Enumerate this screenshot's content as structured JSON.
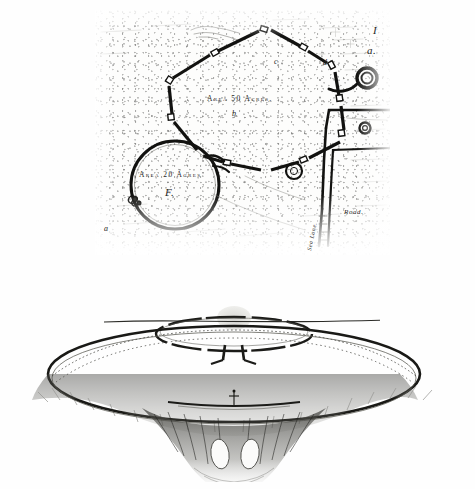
{
  "plate": {
    "title": "Plan and perspective reconstruction of a prehistoric earthwork",
    "ink_color": "#1a1a1a",
    "paper_color": "#fefefe"
  },
  "plan": {
    "name": "upper-plan-map",
    "annotations": {
      "area_polygon": "Area 50 Acres.",
      "area_circle": "Area 20 Acres",
      "circle_letter": "F.",
      "letter_a_lower": "a",
      "letter_b": "b",
      "letter_c": "c",
      "letter_d": "d",
      "letter_a_right": "a.",
      "letter_i": "I",
      "road_label": "Road.",
      "avenue_label": "Sea Lane."
    },
    "features": [
      {
        "name": "polygonal-enclosure",
        "label": "Area 50 Acres."
      },
      {
        "name": "circular-enclosure",
        "label": "Area 20 Acres"
      },
      {
        "name": "spiral-mound-right",
        "label": "a."
      },
      {
        "name": "small-ring-centre",
        "label": ""
      },
      {
        "name": "road-track",
        "label": "Road."
      },
      {
        "name": "avenue-approach",
        "label": "Sea Lane."
      }
    ]
  },
  "view": {
    "name": "lower-perspective-reconstruction",
    "elements": [
      {
        "name": "horizon-line"
      },
      {
        "name": "distant-hill"
      },
      {
        "name": "inner-stone-ring"
      },
      {
        "name": "outer-bank-ring"
      },
      {
        "name": "entrance-causeway"
      },
      {
        "name": "human-figure-scale"
      },
      {
        "name": "quarry-ditch-foreground"
      }
    ]
  }
}
